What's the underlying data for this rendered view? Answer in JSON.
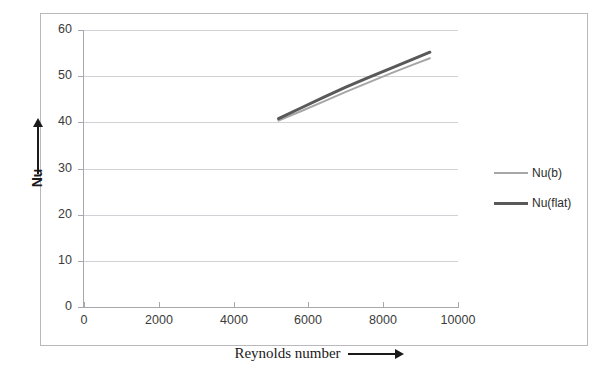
{
  "figure": {
    "cropped_top_text": "",
    "border_color": "#b9b9bd"
  },
  "axes": {
    "y_title": "Nu",
    "y_arrow": "up-arrow",
    "x_title": "Reynolds number",
    "x_arrow": "right-arrow"
  },
  "legend": {
    "position": "right",
    "items": [
      {
        "label": "Nu(b)",
        "color": "#a6a6a6",
        "width": 2
      },
      {
        "label": "Nu(flat)",
        "color": "#595959",
        "width": 3
      }
    ]
  },
  "chart_data": {
    "type": "line",
    "title": "",
    "xlabel": "Reynolds number",
    "ylabel": "Nu",
    "xlim": [
      0,
      10000
    ],
    "ylim": [
      0,
      60
    ],
    "xticks": [
      0,
      2000,
      4000,
      6000,
      8000,
      10000
    ],
    "yticks": [
      0,
      10,
      20,
      30,
      40,
      50,
      60
    ],
    "grid": "horizontal",
    "legend_position": "right",
    "series": [
      {
        "name": "Nu(b)",
        "color": "#a6a6a6",
        "linewidth": 2,
        "x": [
          5200,
          5800,
          6400,
          7000,
          7600,
          8200,
          8800,
          9250
        ],
        "y": [
          40.4,
          42.4,
          44.5,
          46.6,
          48.6,
          50.6,
          52.5,
          53.9
        ]
      },
      {
        "name": "Nu(flat)",
        "color": "#595959",
        "linewidth": 3,
        "x": [
          5200,
          5800,
          6400,
          7000,
          7600,
          8200,
          8800,
          9250
        ],
        "y": [
          40.8,
          43.1,
          45.4,
          47.6,
          49.7,
          51.7,
          53.7,
          55.2
        ]
      }
    ]
  }
}
